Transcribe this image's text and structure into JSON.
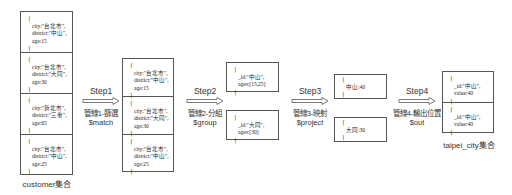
{
  "diagram": {
    "customer": {
      "caption": "customer集合",
      "docs": [
        {
          "open": "{",
          "city": "city:\"台北市\",",
          "district": "district:\"中山\",",
          "age": "age:15",
          "close": "}"
        },
        {
          "open": "{",
          "city": "city:\"台北市\",",
          "district": "district:\"大同\",",
          "age": "age:30",
          "close": "}"
        },
        {
          "open": "{",
          "city": "city:\"新北市\",",
          "district": "district:\"三重\",",
          "age": "age:65",
          "close": "}"
        },
        {
          "open": "{",
          "city": "city:\"台北市\",",
          "district": "district:\"中山\",",
          "age": "age:25",
          "close": "}"
        }
      ]
    },
    "step1": {
      "title": "Step1",
      "label": "管線1-篩選",
      "operator": "$match"
    },
    "matched": {
      "docs": [
        {
          "open": "{",
          "city": "city:\"台北市\",",
          "district": "district:\"中山\",",
          "age": "age:15",
          "close": "}"
        },
        {
          "open": "{",
          "city": "city:\"台北市\",",
          "district": "district:\"大同\",",
          "age": "age:30",
          "close": "}"
        },
        {
          "open": "{",
          "city": "city:\"台北市\",",
          "district": "district:\"中山\",",
          "age": "age:25",
          "close": "}"
        }
      ]
    },
    "step2": {
      "title": "Step2",
      "label": "管線2-分組",
      "operator": "$group"
    },
    "grouped": {
      "docs": [
        {
          "open": "{",
          "id": "_id:\"中山\",",
          "ages": "ages:[15,25]",
          "close": "}"
        },
        {
          "open": "{",
          "id": "_id:\"大同\",",
          "ages": "ages:[30]",
          "close": "}"
        }
      ]
    },
    "step3": {
      "title": "Step3",
      "label": "管線3-映射",
      "operator": "$project"
    },
    "projected": {
      "docs": [
        {
          "open": "{",
          "text": "中山:40",
          "close": "}"
        },
        {
          "open": "{",
          "text": "大同:30",
          "close": "}"
        }
      ]
    },
    "step4": {
      "title": "Step4",
      "label": "管線4-輸出位置",
      "operator": "$out"
    },
    "taipei_city": {
      "caption": "taipei_city集合",
      "docs": [
        {
          "open": "{",
          "id": "_id:\"中山\",",
          "value": "value:40",
          "close": "}"
        },
        {
          "open": "{",
          "id": "_id:\"中山\",",
          "value": "value:40",
          "close": "}"
        }
      ]
    }
  }
}
